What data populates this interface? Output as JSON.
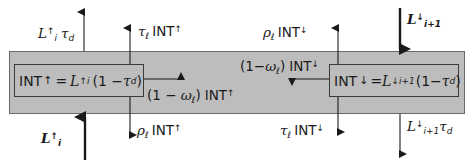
{
  "diagram": {
    "type": "radiative transfer layer schematic",
    "band_color": "#bdbdbd",
    "line_color": "#1a1a1a",
    "boxes": {
      "left": {
        "lhs": "INT",
        "lhs_arrow": "↑",
        "eq": "=",
        "L": "L",
        "L_arrow": "↑",
        "L_sub": "i",
        "factor_open": "(1 − ",
        "tau": "τ",
        "tau_sub": "d",
        "factor_close": ")"
      },
      "right": {
        "lhs": "INT",
        "lhs_arrow": "↓",
        "eq": "=",
        "L": "L",
        "L_arrow": "↓",
        "L_sub": "i+1",
        "factor_open": "(1−",
        "tau": "τ",
        "tau_sub": "d",
        "factor_close": ")"
      }
    },
    "labels": {
      "top_left_transmitted": {
        "L": "L",
        "arrow": "↑",
        "sub": "i",
        "tau": "τ",
        "tau_sub": "d"
      },
      "top_left_emitted": {
        "coef": "τ",
        "coef_sub": "ℓ",
        "text": "INT",
        "arrow": "↑"
      },
      "bottom_left_incoming": {
        "L": "L",
        "arrow": "↑",
        "sub": "i"
      },
      "bottom_left_reflected": {
        "coef": "ρ",
        "coef_sub": "ℓ",
        "text": "INT",
        "arrow": "↑"
      },
      "mid_left_absorbed": {
        "prefix": "(1 − ",
        "coef": "ω",
        "coef_sub": "ℓ",
        "suffix": ")",
        "text": "INT",
        "arrow": "↑"
      },
      "top_right_reflected": {
        "coef": "ρ",
        "coef_sub": "ℓ",
        "text": "INT",
        "arrow": "↓"
      },
      "top_right_incoming": {
        "L": "L",
        "arrow": "↓",
        "sub": "i+1"
      },
      "mid_right_absorbed": {
        "prefix": "(1−",
        "coef": "ω",
        "coef_sub": "ℓ",
        "suffix": ")",
        "text": "INT",
        "arrow": "↓"
      },
      "bottom_right_emitted": {
        "coef": "τ",
        "coef_sub": "ℓ",
        "text": "INT",
        "arrow": "↓"
      },
      "bottom_right_transmitted": {
        "L": "L",
        "arrow": "↓",
        "sub": "i+1",
        "tau": "τ",
        "tau_sub": "d"
      }
    }
  }
}
